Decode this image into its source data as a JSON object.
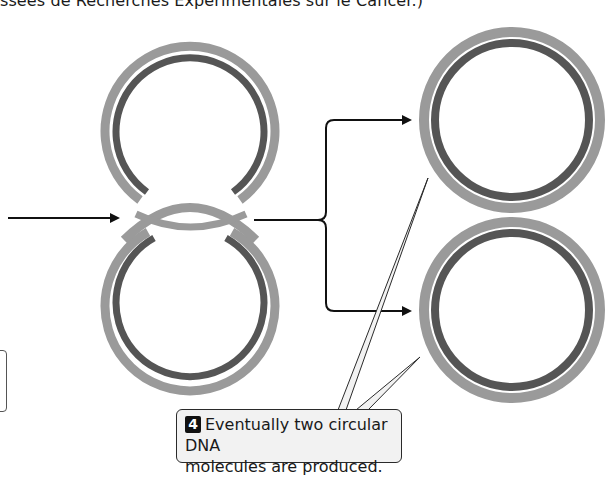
{
  "caption": {
    "top_partial_text": "ssées de Recherches Expérimentales sur le Cancer.)"
  },
  "diagram": {
    "colors": {
      "outer_strand": "#9a9a9a",
      "inner_strand": "#555555",
      "arrow": "#111111",
      "callout_bg": "#f2f2f2",
      "callout_border": "#2a2a2a",
      "badge_bg": "#111111"
    },
    "elements": [
      {
        "id": "catenane-top-circle",
        "cx": 190,
        "cy": 130,
        "r": 85
      },
      {
        "id": "catenane-bottom-circle",
        "cx": 190,
        "cy": 295,
        "r": 85
      },
      {
        "id": "product-top-circle",
        "cx": 512,
        "cy": 120,
        "r": 88
      },
      {
        "id": "product-bottom-circle",
        "cx": 512,
        "cy": 310,
        "r": 88
      }
    ],
    "arrows": [
      {
        "id": "input-arrow",
        "from": [
          8,
          218
        ],
        "to": [
          120,
          218
        ]
      },
      {
        "id": "split-arrow-top",
        "to": [
          412,
          120
        ]
      },
      {
        "id": "split-arrow-bottom",
        "to": [
          412,
          311
        ]
      }
    ]
  },
  "callout": {
    "step_number": "4",
    "line1": "Eventually two circular DNA",
    "line2": "molecules are produced."
  }
}
